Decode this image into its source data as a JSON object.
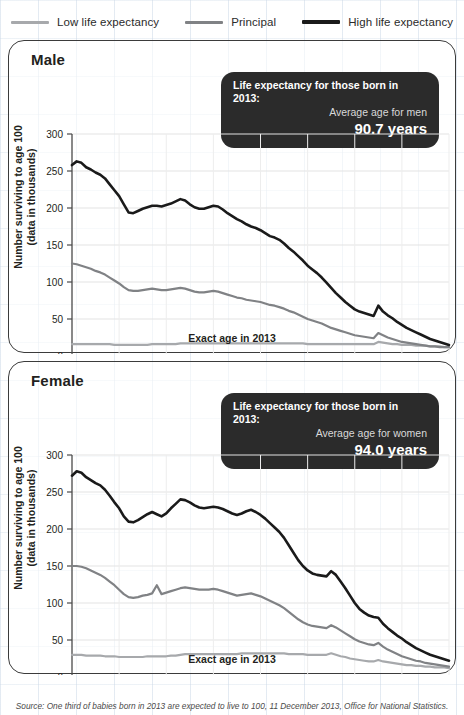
{
  "legend": {
    "items": [
      {
        "label": "Low life expectancy",
        "color": "#a7a9ac",
        "key": "low"
      },
      {
        "label": "Principal",
        "color": "#808285",
        "key": "principal"
      },
      {
        "label": "High life expectancy",
        "color": "#1a1a1a",
        "key": "high"
      }
    ]
  },
  "panels": [
    {
      "title": "Male",
      "callout": {
        "line1": "Life expectancy for those born in 2013:",
        "line2": "Average age for men",
        "line3": "90.7 years"
      },
      "ylabel": "Number surviving to age 100 (data in thousands)",
      "ylabel_line1": "Number surviving to age 100",
      "ylabel_line2": "(data in thousands)",
      "xlabel": "Exact age in 2013"
    },
    {
      "title": "Female",
      "callout": {
        "line1": "Life expectancy for those born in 2013:",
        "line2": "Average age for women",
        "line3": "94.0 years"
      },
      "ylabel": "Number surviving to age 100 (data in thousands)",
      "ylabel_line1": "Number surviving to age 100",
      "ylabel_line2": "(data in thousands)",
      "xlabel": "Exact age in 2013"
    }
  ],
  "source": "Source: One third of babies born in 2013 are expected to live to 100, 11 December 2013, Office for National Statistics.",
  "chart_data": [
    {
      "type": "line",
      "title": "Male",
      "xlabel": "Exact age in 2013",
      "ylabel": "Number surviving to age 100 (data in thousands)",
      "xlim": [
        0,
        80
      ],
      "ylim": [
        0,
        300
      ],
      "xticks": [
        0,
        10,
        20,
        30,
        40,
        50,
        60,
        70,
        80
      ],
      "yticks": [
        0,
        50,
        100,
        150,
        200,
        250,
        300
      ],
      "xminor_step": 1,
      "grid": true,
      "legend_position": "above-figure",
      "x": [
        0,
        1,
        2,
        3,
        4,
        5,
        6,
        7,
        8,
        9,
        10,
        11,
        12,
        13,
        14,
        15,
        16,
        17,
        18,
        19,
        20,
        21,
        22,
        23,
        24,
        25,
        26,
        27,
        28,
        29,
        30,
        31,
        32,
        33,
        34,
        35,
        36,
        37,
        38,
        39,
        40,
        41,
        42,
        43,
        44,
        45,
        46,
        47,
        48,
        49,
        50,
        51,
        52,
        53,
        54,
        55,
        56,
        57,
        58,
        59,
        60,
        61,
        62,
        63,
        64,
        65,
        66,
        67,
        68,
        69,
        70,
        71,
        72,
        73,
        74,
        75,
        76,
        77,
        78,
        79,
        80
      ],
      "series": [
        {
          "name": "High life expectancy",
          "color": "#1a1a1a",
          "values": [
            258,
            263,
            261,
            255,
            252,
            248,
            245,
            240,
            232,
            224,
            216,
            205,
            194,
            193,
            196,
            199,
            201,
            203,
            203,
            202,
            204,
            206,
            209,
            212,
            210,
            205,
            201,
            199,
            199,
            201,
            203,
            202,
            198,
            193,
            189,
            185,
            182,
            178,
            175,
            173,
            170,
            166,
            162,
            160,
            157,
            152,
            146,
            141,
            135,
            129,
            122,
            117,
            112,
            106,
            99,
            92,
            85,
            79,
            73,
            68,
            63,
            60,
            58,
            56,
            54,
            68,
            60,
            55,
            51,
            46,
            42,
            38,
            35,
            32,
            29,
            26,
            23,
            21,
            19,
            17,
            15
          ]
        },
        {
          "name": "Principal",
          "color": "#808285",
          "values": [
            125,
            124,
            122,
            120,
            118,
            115,
            113,
            110,
            106,
            102,
            98,
            93,
            89,
            88,
            88,
            89,
            90,
            91,
            90,
            89,
            89,
            90,
            91,
            92,
            91,
            89,
            87,
            86,
            86,
            87,
            88,
            87,
            85,
            83,
            81,
            79,
            78,
            76,
            75,
            74,
            73,
            71,
            69,
            68,
            66,
            64,
            61,
            59,
            56,
            53,
            50,
            48,
            46,
            44,
            41,
            38,
            36,
            34,
            32,
            30,
            28,
            27,
            26,
            25,
            24,
            31,
            28,
            25,
            23,
            21,
            19,
            18,
            17,
            16,
            15,
            14,
            13,
            13,
            12,
            12,
            12
          ]
        },
        {
          "name": "Low life expectancy",
          "color": "#a7a9ac",
          "values": [
            16,
            16,
            16,
            16,
            16,
            16,
            16,
            16,
            16,
            15,
            15,
            15,
            15,
            15,
            15,
            15,
            15,
            16,
            16,
            16,
            16,
            16,
            16,
            17,
            17,
            17,
            17,
            17,
            17,
            17,
            17,
            17,
            17,
            17,
            17,
            17,
            17,
            17,
            17,
            17,
            17,
            17,
            17,
            17,
            17,
            17,
            17,
            17,
            17,
            17,
            16,
            16,
            16,
            16,
            16,
            16,
            16,
            16,
            16,
            16,
            16,
            16,
            16,
            16,
            16,
            19,
            18,
            17,
            16,
            16,
            15,
            15,
            15,
            14,
            14,
            14,
            13,
            13,
            13,
            12,
            12
          ]
        }
      ]
    },
    {
      "type": "line",
      "title": "Female",
      "xlabel": "Exact age in 2013",
      "ylabel": "Number surviving to age 100 (data in thousands)",
      "xlim": [
        0,
        80
      ],
      "ylim": [
        0,
        300
      ],
      "xticks": [
        0,
        10,
        20,
        30,
        40,
        50,
        60,
        70,
        80
      ],
      "yticks": [
        0,
        50,
        100,
        150,
        200,
        250,
        300
      ],
      "xminor_step": 1,
      "grid": true,
      "legend_position": "above-figure",
      "x": [
        0,
        1,
        2,
        3,
        4,
        5,
        6,
        7,
        8,
        9,
        10,
        11,
        12,
        13,
        14,
        15,
        16,
        17,
        18,
        19,
        20,
        21,
        22,
        23,
        24,
        25,
        26,
        27,
        28,
        29,
        30,
        31,
        32,
        33,
        34,
        35,
        36,
        37,
        38,
        39,
        40,
        41,
        42,
        43,
        44,
        45,
        46,
        47,
        48,
        49,
        50,
        51,
        52,
        53,
        54,
        55,
        56,
        57,
        58,
        59,
        60,
        61,
        62,
        63,
        64,
        65,
        66,
        67,
        68,
        69,
        70,
        71,
        72,
        73,
        74,
        75,
        76,
        77,
        78,
        79,
        80
      ],
      "series": [
        {
          "name": "High life expectancy",
          "color": "#1a1a1a",
          "values": [
            272,
            278,
            276,
            270,
            266,
            262,
            259,
            253,
            245,
            236,
            228,
            217,
            210,
            209,
            212,
            216,
            220,
            223,
            220,
            217,
            221,
            228,
            234,
            240,
            239,
            236,
            232,
            229,
            228,
            229,
            230,
            229,
            227,
            224,
            221,
            219,
            221,
            224,
            226,
            223,
            219,
            214,
            208,
            202,
            196,
            188,
            178,
            168,
            158,
            150,
            144,
            140,
            138,
            137,
            136,
            143,
            138,
            129,
            120,
            110,
            100,
            92,
            87,
            83,
            81,
            80,
            72,
            66,
            61,
            56,
            52,
            47,
            43,
            39,
            36,
            33,
            30,
            28,
            26,
            24,
            22
          ]
        },
        {
          "name": "Principal",
          "color": "#808285",
          "values": [
            150,
            150,
            149,
            147,
            144,
            141,
            138,
            134,
            129,
            124,
            118,
            112,
            108,
            107,
            108,
            110,
            111,
            113,
            124,
            112,
            114,
            116,
            118,
            120,
            121,
            120,
            119,
            118,
            118,
            118,
            119,
            118,
            116,
            114,
            112,
            110,
            111,
            112,
            113,
            111,
            109,
            106,
            103,
            100,
            97,
            93,
            88,
            83,
            78,
            74,
            71,
            69,
            68,
            67,
            66,
            70,
            67,
            63,
            59,
            55,
            51,
            48,
            46,
            44,
            43,
            46,
            41,
            37,
            34,
            31,
            28,
            26,
            24,
            22,
            21,
            19,
            18,
            17,
            16,
            15,
            14
          ]
        },
        {
          "name": "Low life expectancy",
          "color": "#a7a9ac",
          "values": [
            30,
            30,
            30,
            29,
            29,
            29,
            29,
            28,
            28,
            28,
            27,
            27,
            27,
            27,
            27,
            27,
            28,
            28,
            28,
            28,
            28,
            29,
            29,
            30,
            31,
            31,
            31,
            31,
            31,
            31,
            31,
            31,
            31,
            31,
            31,
            31,
            32,
            32,
            32,
            32,
            32,
            32,
            32,
            32,
            32,
            32,
            31,
            31,
            31,
            31,
            30,
            30,
            30,
            30,
            30,
            32,
            30,
            28,
            27,
            25,
            24,
            23,
            22,
            21,
            21,
            23,
            21,
            20,
            19,
            18,
            17,
            16,
            16,
            15,
            15,
            14,
            14,
            13,
            13,
            13,
            12
          ]
        }
      ]
    }
  ]
}
